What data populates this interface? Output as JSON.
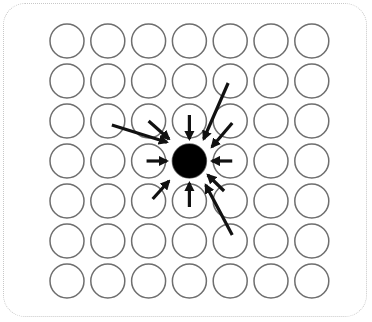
{
  "diagram": {
    "type": "grid-attraction",
    "grid": {
      "rows": 7,
      "cols": 7,
      "x0": 67,
      "y0": 41,
      "dx": 40.8,
      "dy": 40,
      "r": 17
    },
    "colors": {
      "circle_stroke": "#6e6e6e",
      "center_fill": "#000000",
      "arrow": "#111111",
      "frame": "#c8c8c8"
    },
    "center_cell": {
      "row": 3,
      "col": 3,
      "r": 17
    },
    "arrows": [
      {
        "from": [
          -1.9,
          -0.9
        ],
        "to": [
          -0.55,
          -0.47
        ],
        "label": "long-left-upper"
      },
      {
        "from": [
          -1.0,
          -1.0
        ],
        "to": [
          -0.5,
          -0.55
        ],
        "label": "upper-left"
      },
      {
        "from": [
          0.0,
          -1.15
        ],
        "to": [
          0.0,
          -0.55
        ],
        "label": "top"
      },
      {
        "from": [
          0.95,
          -1.95
        ],
        "to": [
          0.35,
          -0.55
        ],
        "label": "long-upper-right"
      },
      {
        "from": [
          1.05,
          -0.95
        ],
        "to": [
          0.55,
          -0.35
        ],
        "label": "upper-right"
      },
      {
        "from": [
          -1.05,
          0.0
        ],
        "to": [
          -0.55,
          0.0
        ],
        "label": "left"
      },
      {
        "from": [
          1.05,
          0.0
        ],
        "to": [
          0.55,
          0.0
        ],
        "label": "right"
      },
      {
        "from": [
          -0.9,
          0.95
        ],
        "to": [
          -0.5,
          0.5
        ],
        "label": "lower-left"
      },
      {
        "from": [
          0.0,
          1.15
        ],
        "to": [
          0.0,
          0.55
        ],
        "label": "bottom"
      },
      {
        "from": [
          0.85,
          0.75
        ],
        "to": [
          0.45,
          0.35
        ],
        "label": "lower-right"
      },
      {
        "from": [
          1.05,
          1.85
        ],
        "to": [
          0.4,
          0.6
        ],
        "label": "long-lower-right"
      }
    ]
  }
}
